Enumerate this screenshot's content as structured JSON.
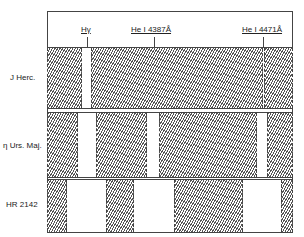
{
  "diagram": {
    "lines": [
      {
        "label": "Hγ",
        "x": 87
      },
      {
        "label": "He I 4387Å",
        "x": 154
      },
      {
        "label": "He I 4471Å",
        "x": 263
      }
    ],
    "rows": [
      {
        "name": "J Herc.",
        "top": 47,
        "height": 62,
        "hatched": [
          [
            47,
            82
          ],
          [
            91,
            263
          ],
          [
            264,
            293
          ]
        ]
      },
      {
        "name": "η Urs. Maj.",
        "top": 112,
        "height": 66,
        "hatched": [
          [
            47,
            78
          ],
          [
            96,
            147
          ],
          [
            159,
            257
          ],
          [
            267,
            293
          ]
        ]
      },
      {
        "name": "HR 2142",
        "top": 179,
        "height": 54,
        "hatched": [
          [
            47,
            67
          ],
          [
            106,
            134
          ],
          [
            174,
            243
          ],
          [
            281,
            293
          ]
        ]
      }
    ]
  }
}
